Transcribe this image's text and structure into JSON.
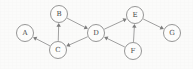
{
  "diagram": {
    "type": "directed-graph",
    "title": "",
    "background_color": "#fbfbfa",
    "node_fill_color": "#fdfdfc",
    "node_stroke_color": "#8a8a8a",
    "edge_color": "#8f8f8f",
    "label_color": "#4a4a4a",
    "node_radius": 8.5,
    "nodes": [
      {
        "id": "A",
        "label": "A",
        "x": 25,
        "y": 33
      },
      {
        "id": "B",
        "label": "B",
        "x": 59,
        "y": 14
      },
      {
        "id": "C",
        "label": "C",
        "x": 58,
        "y": 50
      },
      {
        "id": "D",
        "label": "D",
        "x": 96,
        "y": 33
      },
      {
        "id": "E",
        "label": "E",
        "x": 135,
        "y": 15
      },
      {
        "id": "F",
        "label": "F",
        "x": 133,
        "y": 51
      },
      {
        "id": "G",
        "label": "G",
        "x": 172,
        "y": 33
      }
    ],
    "edges": [
      {
        "from": "C",
        "to": "A",
        "directed": true
      },
      {
        "from": "C",
        "to": "B",
        "directed": true
      },
      {
        "from": "B",
        "to": "D",
        "directed": true
      },
      {
        "from": "D",
        "to": "C",
        "directed": true
      },
      {
        "from": "D",
        "to": "E",
        "directed": true
      },
      {
        "from": "F",
        "to": "D",
        "directed": true
      },
      {
        "from": "F",
        "to": "E",
        "directed": true
      },
      {
        "from": "E",
        "to": "G",
        "directed": true
      }
    ]
  }
}
